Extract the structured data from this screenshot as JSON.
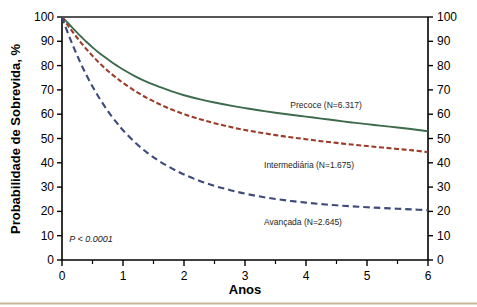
{
  "chart_data": {
    "type": "line",
    "title": "",
    "subtitle": "",
    "xlabel": "Anos",
    "ylabel": "Probabilidade de Sobrevida, %",
    "xlim": [
      0,
      6
    ],
    "ylim": [
      0,
      100
    ],
    "grid": false,
    "legend_position": "inline-annotations",
    "x_ticks": [
      0,
      1,
      2,
      3,
      4,
      5,
      6
    ],
    "x_tick_labels": [
      "0",
      "1",
      "2",
      "3",
      "4",
      "5",
      "6"
    ],
    "x_minor_ticks": [
      0.5,
      1.5,
      2.5,
      3.5,
      4.5,
      5.5
    ],
    "y_ticks": [
      0,
      10,
      20,
      30,
      40,
      50,
      60,
      70,
      80,
      90,
      100
    ],
    "y_tick_labels": [
      "0",
      "10",
      "20",
      "30",
      "40",
      "50",
      "60",
      "70",
      "80",
      "90",
      "100"
    ],
    "right_axis": {
      "visible": true,
      "ticks": [
        0,
        10,
        20,
        30,
        40,
        50,
        60,
        70,
        80,
        90,
        100
      ],
      "tick_labels": [
        "0",
        "10",
        "20",
        "30",
        "40",
        "50",
        "60",
        "70",
        "80",
        "90",
        "100"
      ]
    },
    "annotations": [
      {
        "text": "P < 0.0001",
        "x": 0.12,
        "y": 7.5,
        "style": "italic"
      }
    ],
    "x": [
      0,
      0.1,
      0.2,
      0.3,
      0.4,
      0.5,
      0.6,
      0.7,
      0.8,
      0.9,
      1.0,
      1.2,
      1.4,
      1.6,
      1.8,
      2.0,
      2.25,
      2.5,
      2.75,
      3.0,
      3.25,
      3.5,
      3.75,
      4.0,
      4.25,
      4.5,
      4.75,
      5.0,
      5.25,
      5.5,
      5.75,
      6.0
    ],
    "series": [
      {
        "name": "Precoce",
        "label": "Precoce (N=6.317)",
        "n": "6.317",
        "color": "#3c6b4c",
        "style": "solid",
        "label_x": 4.33,
        "label_y": 62.5,
        "values": [
          100,
          97.5,
          94.8,
          92.2,
          89.8,
          87.5,
          85.4,
          83.5,
          81.7,
          80.0,
          78.4,
          75.6,
          73.2,
          71.2,
          69.4,
          67.8,
          66.2,
          64.8,
          63.6,
          62.5,
          61.5,
          60.6,
          59.8,
          59.0,
          58.2,
          57.4,
          56.6,
          55.9,
          55.2,
          54.5,
          53.8,
          53.0
        ]
      },
      {
        "name": "Intermediária",
        "label": "Intermediária (N=1.675)",
        "n": "1.675",
        "color": "#9c3c28",
        "style": "dashed",
        "label_x": 4.05,
        "label_y": 38.0,
        "values": [
          100,
          96.4,
          93.0,
          89.8,
          86.8,
          84.0,
          81.4,
          79.0,
          76.8,
          74.8,
          72.9,
          69.5,
          66.6,
          64.1,
          61.9,
          60.0,
          58.0,
          56.3,
          54.8,
          53.5,
          52.4,
          51.4,
          50.5,
          49.7,
          48.9,
          48.2,
          47.5,
          46.9,
          46.3,
          45.7,
          45.1,
          44.4
        ]
      },
      {
        "name": "Avançada",
        "label": "Avançada (N=2.645)",
        "n": "2.645",
        "color": "#3d4a7a",
        "style": "dashed",
        "label_x": 3.95,
        "label_y": 14.5,
        "values": [
          100,
          93.2,
          87.0,
          81.3,
          76.1,
          71.4,
          67.1,
          63.2,
          59.6,
          56.4,
          53.4,
          48.3,
          44.1,
          40.6,
          37.7,
          35.2,
          32.6,
          30.5,
          28.8,
          27.3,
          26.1,
          25.1,
          24.3,
          23.6,
          23.0,
          22.5,
          22.1,
          21.7,
          21.4,
          21.1,
          20.8,
          20.5
        ]
      }
    ]
  },
  "decor": {
    "bottom_rule_color": "#c9b79a"
  }
}
